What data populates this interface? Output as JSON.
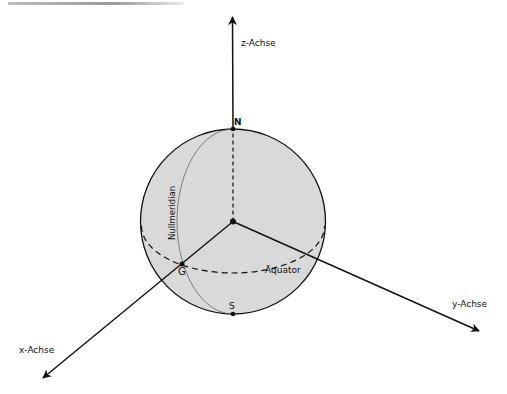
{
  "diagram": {
    "type": "sphere-coordinate-system",
    "colors": {
      "sphere_fill": "#d9d9d9",
      "stroke": "#111111",
      "meridian": "#555555"
    },
    "axes": {
      "z": {
        "label": "z-Achse"
      },
      "x": {
        "label": "x-Achse"
      },
      "y": {
        "label": "y-Achse"
      }
    },
    "points": {
      "north": {
        "label": "N"
      },
      "south": {
        "label": "S"
      },
      "greenwich": {
        "label": "G"
      },
      "center": {
        "label": ""
      }
    },
    "curves": {
      "meridian": {
        "label": "Nullmeridian"
      },
      "equator": {
        "label": "Äquator"
      }
    }
  }
}
